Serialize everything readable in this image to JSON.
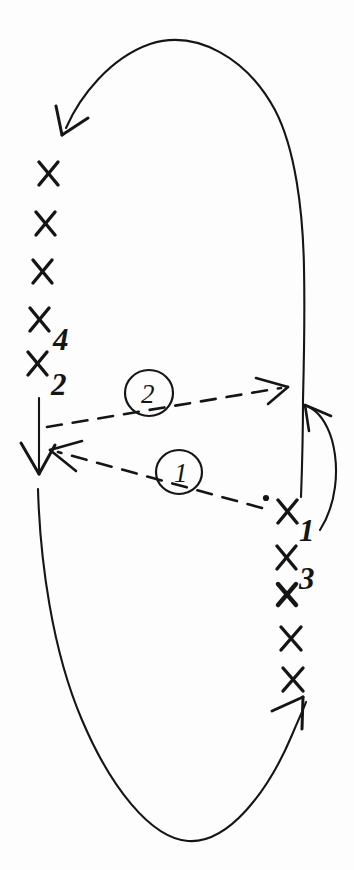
{
  "diagram": {
    "background_color": "#fdfdfd",
    "ink_color": "#151515",
    "width": 354,
    "height": 870,
    "loop": {
      "name": "closed-loop-cycle",
      "style": "solid",
      "direction": "counterclockwise",
      "description": "Tall closed loop with arrowheads at top-left, left-middle and bottom-right"
    },
    "point_labels": {
      "x1": "X",
      "x1_sub": "1",
      "x2": "X",
      "x2_sub": "2",
      "x3": "X",
      "x3_sub": "3",
      "x4": "X",
      "x4_sub": "4"
    },
    "step_labels": {
      "step_one": "1",
      "step_two": "2"
    },
    "left_marks": [
      {
        "name": "left-x-mark-1",
        "label": "X",
        "sub": ""
      },
      {
        "name": "left-x-mark-2",
        "label": "X",
        "sub": ""
      },
      {
        "name": "left-x-mark-3",
        "label": "X",
        "sub": ""
      },
      {
        "name": "left-x-mark-4",
        "label": "X",
        "sub": "4"
      },
      {
        "name": "left-x-mark-5",
        "label": "X",
        "sub": "2"
      }
    ],
    "right_marks": [
      {
        "name": "right-x-mark-1",
        "label": "X",
        "sub": "1"
      },
      {
        "name": "right-x-mark-2",
        "label": "X",
        "sub": "3"
      },
      {
        "name": "right-x-mark-3",
        "label": "X",
        "sub": ""
      },
      {
        "name": "right-x-mark-4",
        "label": "X",
        "sub": ""
      },
      {
        "name": "right-x-mark-5",
        "label": "X",
        "sub": ""
      }
    ],
    "dashed_arrows": [
      {
        "name": "dashed-arrow-one",
        "label": "1",
        "from": "X1",
        "to": "X2",
        "direction": "right-to-left"
      },
      {
        "name": "dashed-arrow-two",
        "label": "2",
        "from": "X2",
        "to": "right side of loop",
        "direction": "left-to-right"
      }
    ]
  }
}
